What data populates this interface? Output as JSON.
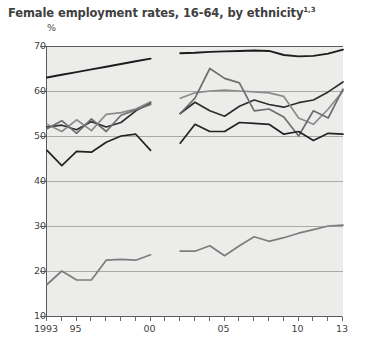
{
  "title_main": "Female employment rates, 16-64, by ethnicity",
  "title_sup": "1,3",
  "y_unit": "%",
  "chart_data": {
    "type": "line",
    "title": "Female employment rates, 16-64, by ethnicity1,3",
    "xlabel": "",
    "ylabel": "%",
    "ylim": [
      10,
      70
    ],
    "xlim": [
      1993,
      2013
    ],
    "yticks": [
      10,
      20,
      30,
      40,
      50,
      60,
      70
    ],
    "xticks": [
      1993,
      1994,
      1995,
      1996,
      1997,
      1998,
      1999,
      2000,
      2001,
      2002,
      2003,
      2004,
      2005,
      2006,
      2007,
      2008,
      2009,
      2010,
      2011,
      2012,
      2013
    ],
    "xtick_labels": [
      {
        "x": 1993,
        "label": "1993"
      },
      {
        "x": 1995,
        "label": "95"
      },
      {
        "x": 2000,
        "label": "00"
      },
      {
        "x": 2005,
        "label": "05"
      },
      {
        "x": 2010,
        "label": "10"
      },
      {
        "x": 2013,
        "label": "13"
      }
    ],
    "grid": true,
    "legend": "none",
    "note": "Series are broken between 2000 and 2002 due to a discontinuity in the data source.",
    "series": [
      {
        "name": "White",
        "color": "#1c1c1c",
        "width": 1.9,
        "segments": [
          {
            "x": [
              1993,
              1994,
              1995,
              1996,
              1997,
              1998,
              1999,
              2000
            ],
            "y": [
              63.0,
              63.6,
              64.2,
              64.8,
              65.4,
              66.0,
              66.6,
              67.2
            ]
          },
          {
            "x": [
              2002,
              2003,
              2004,
              2005,
              2006,
              2007,
              2008,
              2009,
              2010,
              2011,
              2012,
              2013
            ],
            "y": [
              68.4,
              68.5,
              68.7,
              68.8,
              68.9,
              69.0,
              68.9,
              68.0,
              67.7,
              67.8,
              68.3,
              69.2
            ]
          }
        ]
      },
      {
        "name": "Indian",
        "color": "#2e2e2e",
        "width": 1.7,
        "segments": [
          {
            "x": [
              1993,
              1994,
              1995,
              1996,
              1997,
              1998,
              1999,
              2000
            ],
            "y": [
              52.0,
              52.4,
              51.4,
              53.2,
              52.0,
              53.0,
              55.6,
              57.4
            ]
          },
          {
            "x": [
              2002,
              2003,
              2004,
              2005,
              2006,
              2007,
              2008,
              2009,
              2010,
              2011,
              2012,
              2013
            ],
            "y": [
              55.0,
              57.5,
              55.6,
              54.4,
              56.6,
              58.0,
              57.0,
              56.4,
              57.4,
              58.0,
              59.8,
              62.0
            ]
          }
        ]
      },
      {
        "name": "Black Caribbean",
        "color": "#8c8c8c",
        "width": 1.7,
        "segments": [
          {
            "x": [
              1993,
              1994,
              1995,
              1996,
              1997,
              1998,
              1999,
              2000
            ],
            "y": [
              52.6,
              51.0,
              53.6,
              51.2,
              54.8,
              55.2,
              56.0,
              57.6
            ]
          },
          {
            "x": [
              2002,
              2003,
              2004,
              2005,
              2006,
              2007,
              2008,
              2009,
              2010,
              2011,
              2012,
              2013
            ],
            "y": [
              58.4,
              59.6,
              60.0,
              60.2,
              60.0,
              59.8,
              59.6,
              58.8,
              54.0,
              52.6,
              56.0,
              60.0
            ]
          }
        ]
      },
      {
        "name": "Black African",
        "color": "#6e6e6e",
        "width": 1.7,
        "segments": [
          {
            "x": [
              1993,
              1994,
              1995,
              1996,
              1997,
              1998,
              1999,
              2000
            ],
            "y": [
              51.6,
              53.4,
              50.6,
              53.8,
              51.0,
              54.6,
              55.8,
              57.0
            ]
          },
          {
            "x": [
              2002,
              2003,
              2004,
              2005,
              2006,
              2007,
              2008,
              2009,
              2010,
              2011,
              2012,
              2013
            ],
            "y": [
              55.0,
              58.4,
              65.0,
              62.8,
              61.8,
              55.6,
              56.0,
              54.2,
              50.0,
              55.6,
              54.0,
              60.4
            ]
          }
        ]
      },
      {
        "name": "Mixed / Other",
        "color": "#222222",
        "width": 1.7,
        "segments": [
          {
            "x": [
              1993,
              1994,
              1995,
              1996,
              1997,
              1998,
              1999,
              2000
            ],
            "y": [
              46.8,
              43.4,
              46.6,
              46.4,
              48.6,
              50.0,
              50.4,
              46.8
            ]
          },
          {
            "x": [
              2002,
              2003,
              2004,
              2005,
              2006,
              2007,
              2008,
              2009,
              2010,
              2011,
              2012,
              2013
            ],
            "y": [
              48.4,
              52.6,
              51.0,
              51.0,
              53.0,
              52.8,
              52.6,
              50.4,
              51.0,
              49.0,
              50.6,
              50.4
            ]
          }
        ]
      },
      {
        "name": "Pakistani / Bangladeshi",
        "color": "#7d7d7d",
        "width": 1.7,
        "segments": [
          {
            "x": [
              1993,
              1994,
              1995,
              1996,
              1997,
              1998,
              1999,
              2000
            ],
            "y": [
              17.0,
              20.0,
              18.0,
              18.0,
              22.4,
              22.6,
              22.4,
              23.6
            ]
          },
          {
            "x": [
              2002,
              2003,
              2004,
              2005,
              2006,
              2007,
              2008,
              2009,
              2010,
              2011,
              2012,
              2013
            ],
            "y": [
              24.4,
              24.4,
              25.6,
              23.4,
              25.6,
              27.6,
              26.6,
              27.4,
              28.4,
              29.2,
              30.0,
              30.2
            ]
          }
        ]
      }
    ]
  }
}
